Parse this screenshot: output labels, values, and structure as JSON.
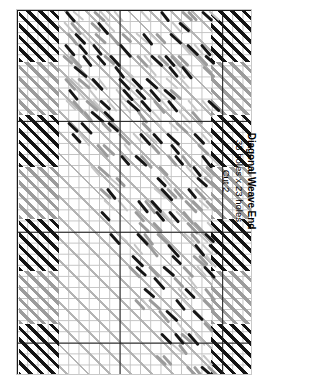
{
  "document": {
    "kind": "plastic-canvas-stitch-chart",
    "orientation": "rotated-90"
  },
  "caption": {
    "title": "Diagonal Weave End",
    "dimensions": "33 holes x 23 holes",
    "cut": "Cut 2"
  },
  "edge_label": {
    "text": "Cut 2"
  },
  "colors": {
    "black_yarn": "#151515",
    "gray_yarn": "#9b9b9b",
    "light_lattice": "#b0b0b0",
    "grid_fine": "#b8b8b8",
    "grid_bold": "#1a1a1a",
    "frame_border": "#c9c9c9",
    "background": "#ffffff"
  },
  "chart_data": {
    "type": "heatmap",
    "title": "Diagonal Weave End",
    "xlabel": "holes across",
    "ylabel": "holes down",
    "grid": true,
    "legend_position": "right",
    "canvas": {
      "holes_across": 23,
      "holes_down": 33,
      "bold_grid_every": 10
    },
    "legend": [
      {
        "name": "Black yarn diagonal stitch",
        "color": "#151515"
      },
      {
        "name": "Gray yarn diagonal stitch",
        "color": "#9b9b9b"
      },
      {
        "name": "Light gray long diagonal weave",
        "color": "#b0b0b0"
      }
    ],
    "regions": [
      {
        "name": "left-border-column",
        "x": [
          0,
          4
        ],
        "y": [
          0,
          33
        ],
        "pattern": "alternating black/gray diagonal hatch blocks"
      },
      {
        "name": "right-border-column",
        "x": [
          19,
          23
        ],
        "y": [
          0,
          33
        ],
        "pattern": "alternating black/gray diagonal hatch blocks"
      },
      {
        "name": "interior-weave",
        "x": [
          4,
          19
        ],
        "y": [
          0,
          33
        ],
        "pattern": "light diagonal lattice with scattered black and gray stitches"
      }
    ],
    "edge_blocks": [
      {
        "side": "left",
        "row_band": 0,
        "color": "#151515"
      },
      {
        "side": "left",
        "row_band": 1,
        "color": "#9b9b9b"
      },
      {
        "side": "left",
        "row_band": 2,
        "color": "#151515"
      },
      {
        "side": "left",
        "row_band": 3,
        "color": "#9b9b9b"
      },
      {
        "side": "left",
        "row_band": 4,
        "color": "#151515"
      },
      {
        "side": "left",
        "row_band": 5,
        "color": "#9b9b9b"
      },
      {
        "side": "left",
        "row_band": 6,
        "color": "#151515"
      },
      {
        "side": "right",
        "row_band": 0,
        "color": "#151515"
      },
      {
        "side": "right",
        "row_band": 1,
        "color": "#9b9b9b"
      },
      {
        "side": "right",
        "row_band": 2,
        "color": "#151515"
      },
      {
        "side": "right",
        "row_band": 3,
        "color": "#9b9b9b"
      },
      {
        "side": "right",
        "row_band": 4,
        "color": "#151515"
      },
      {
        "side": "right",
        "row_band": 5,
        "color": "#9b9b9b"
      },
      {
        "side": "right",
        "row_band": 6,
        "color": "#151515"
      }
    ]
  }
}
